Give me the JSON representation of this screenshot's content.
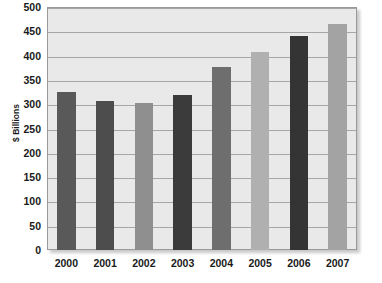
{
  "chart_data": {
    "type": "bar",
    "title": "",
    "xlabel": "",
    "ylabel": "$ Billions",
    "categories": [
      "2000",
      "2001",
      "2002",
      "2003",
      "2004",
      "2005",
      "2006",
      "2007"
    ],
    "values": [
      325,
      307,
      303,
      318,
      376,
      407,
      441,
      465
    ],
    "bar_colors": [
      "#595959",
      "#4d4d4d",
      "#8f8f8f",
      "#3b3b3b",
      "#6e6e6e",
      "#b0b0b0",
      "#343434",
      "#a3a3a3"
    ],
    "ylim": [
      0,
      500
    ],
    "yticks": [
      0,
      50,
      100,
      150,
      200,
      250,
      300,
      350,
      400,
      450,
      500
    ],
    "ytick_labels": [
      "0",
      "50",
      "100",
      "150",
      "200",
      "250",
      "300",
      "350",
      "400",
      "450",
      "500"
    ],
    "grid": true,
    "legend": "none",
    "plot_background": "#e9e9e9",
    "gridline_color": "#a6a6a6",
    "axis_text_color": "#1a1a1a"
  }
}
